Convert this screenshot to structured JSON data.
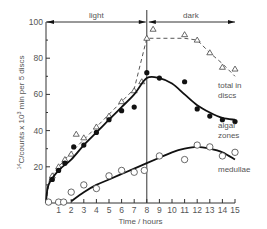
{
  "chart_data": {
    "type": "line",
    "title": "",
    "xlabel": "Time / hours",
    "ylabel": "14C/counts x 10^3 min per 5 discs",
    "ylabel_parts": {
      "sup": "14",
      "main": "C/counts x 10",
      "sup2": "3",
      "tail": " min per 5 discs"
    },
    "xlim": [
      0,
      15
    ],
    "ylim": [
      0,
      100
    ],
    "x_ticks": [
      1,
      2,
      3,
      4,
      5,
      6,
      7,
      8,
      9,
      10,
      11,
      12,
      13,
      14,
      15
    ],
    "y_ticks": [
      20,
      40,
      60,
      80,
      100
    ],
    "grid": false,
    "annotations": {
      "light": {
        "label": "light",
        "from": 0,
        "to": 8
      },
      "dark": {
        "label": "dark",
        "from": 8,
        "to": 15
      },
      "divider_x": 8
    },
    "series": [
      {
        "name": "total in discs",
        "label_lines": [
          "total in",
          "discs"
        ],
        "marker": "triangle-open",
        "line_style": "dashed",
        "points": [
          [
            0.5,
            15
          ],
          [
            1,
            20
          ],
          [
            1.5,
            24
          ],
          [
            2,
            27
          ],
          [
            2.4,
            38
          ],
          [
            3,
            36
          ],
          [
            4,
            42
          ],
          [
            5,
            48
          ],
          [
            6,
            56
          ],
          [
            7,
            62
          ],
          [
            7.6,
            67
          ],
          [
            8,
            91
          ],
          [
            8.5,
            96
          ],
          [
            11,
            93
          ],
          [
            12,
            90
          ],
          [
            13,
            83
          ],
          [
            14,
            75
          ],
          [
            15,
            74
          ]
        ],
        "fit": [
          [
            0,
            0
          ],
          [
            0.3,
            14
          ],
          [
            1,
            20
          ],
          [
            2,
            28
          ],
          [
            3,
            35
          ],
          [
            4,
            42
          ],
          [
            5,
            49
          ],
          [
            6,
            56
          ],
          [
            7,
            63
          ],
          [
            8,
            91
          ],
          [
            11,
            91
          ],
          [
            12,
            90
          ],
          [
            13,
            83
          ],
          [
            14,
            77
          ],
          [
            15,
            70
          ]
        ]
      },
      {
        "name": "algal zones",
        "label_lines": [
          "algal",
          "zones"
        ],
        "marker": "circle-filled",
        "line_style": "solid-bold",
        "points": [
          [
            0.5,
            13
          ],
          [
            1,
            18
          ],
          [
            1.5,
            22
          ],
          [
            2.2,
            31
          ],
          [
            3,
            32
          ],
          [
            4,
            39
          ],
          [
            5,
            46
          ],
          [
            6,
            51
          ],
          [
            7,
            53
          ],
          [
            8,
            72
          ],
          [
            9,
            69
          ],
          [
            11,
            67
          ],
          [
            12,
            52
          ],
          [
            13,
            48
          ],
          [
            14,
            46
          ],
          [
            15,
            45
          ]
        ],
        "fit": [
          [
            0,
            0
          ],
          [
            0.2,
            10
          ],
          [
            1,
            18
          ],
          [
            2,
            24
          ],
          [
            3,
            32
          ],
          [
            4,
            39
          ],
          [
            5,
            46
          ],
          [
            6,
            53
          ],
          [
            7,
            60
          ],
          [
            8,
            69
          ],
          [
            9,
            69
          ],
          [
            10,
            66
          ],
          [
            11,
            60
          ],
          [
            12,
            54
          ],
          [
            13,
            50
          ],
          [
            14,
            47
          ],
          [
            15,
            46
          ]
        ]
      },
      {
        "name": "medullae",
        "label_lines": [
          "medullae"
        ],
        "marker": "circle-open",
        "line_style": "solid-bold",
        "points": [
          [
            0.2,
            0.5
          ],
          [
            1,
            0.5
          ],
          [
            1.4,
            0.5
          ],
          [
            2,
            6
          ],
          [
            3,
            10
          ],
          [
            4,
            8
          ],
          [
            5,
            15
          ],
          [
            6,
            18
          ],
          [
            7,
            17
          ],
          [
            7.8,
            18
          ],
          [
            9,
            26
          ],
          [
            11,
            24
          ],
          [
            12,
            32
          ],
          [
            13,
            31
          ],
          [
            14,
            26
          ],
          [
            15,
            28
          ]
        ],
        "fit": [
          [
            2,
            1
          ],
          [
            3,
            6
          ],
          [
            4,
            10
          ],
          [
            5,
            13
          ],
          [
            6,
            16
          ],
          [
            7,
            19
          ],
          [
            8,
            22
          ],
          [
            9,
            25
          ],
          [
            10,
            28
          ],
          [
            11,
            30
          ],
          [
            12,
            31
          ],
          [
            13,
            30
          ],
          [
            14,
            28
          ],
          [
            15,
            24
          ]
        ]
      }
    ]
  }
}
